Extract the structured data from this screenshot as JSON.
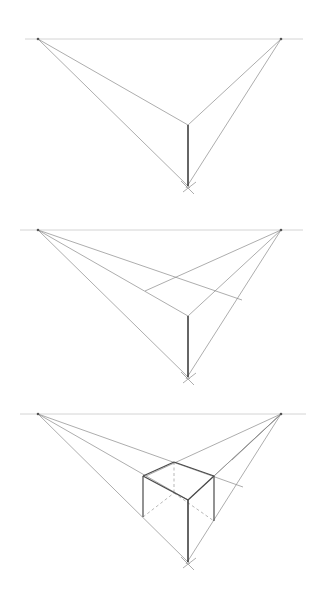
{
  "colors": {
    "background": "#ffffff",
    "horizon": "#c9c9c9",
    "guide": "#8a8a8a",
    "edge": "#4a4a4a",
    "hidden": "#9a9a9a"
  },
  "panels": [
    {
      "name": "step-1-vanishing-points",
      "horizon": {
        "x1": 25,
        "x2": 303,
        "y": 39
      },
      "vp_left": [
        38,
        39
      ],
      "vp_right": [
        281,
        39
      ],
      "vp_bottom": [
        188,
        186
      ],
      "guides": [
        [
          38,
          39,
          188,
          125
        ],
        [
          281,
          39,
          188,
          125
        ],
        [
          38,
          39,
          190,
          188
        ],
        [
          281,
          39,
          186,
          188
        ],
        [
          183,
          192,
          196,
          182
        ],
        [
          181,
          181,
          194,
          194
        ]
      ],
      "edges": [
        [
          188,
          125,
          188,
          186
        ]
      ],
      "hidden": []
    },
    {
      "name": "step-2-top-face",
      "horizon": {
        "x1": 20,
        "x2": 303,
        "y": 230
      },
      "vp_left": [
        38,
        230
      ],
      "vp_right": [
        281,
        230
      ],
      "vp_bottom": [
        188,
        377
      ],
      "guides": [
        [
          38,
          230,
          188,
          316
        ],
        [
          281,
          230,
          188,
          316
        ],
        [
          38,
          230,
          190,
          379
        ],
        [
          281,
          230,
          186,
          379
        ],
        [
          38,
          230,
          242,
          300
        ],
        [
          281,
          230,
          145,
          291
        ],
        [
          183,
          383,
          196,
          373
        ],
        [
          181,
          372,
          194,
          385
        ]
      ],
      "edges": [
        [
          188,
          316,
          188,
          377
        ]
      ],
      "hidden": []
    },
    {
      "name": "step-3-box",
      "horizon": {
        "x1": 20,
        "x2": 306,
        "y": 414
      },
      "vp_left": [
        38,
        414
      ],
      "vp_right": [
        281,
        414
      ],
      "vp_bottom": [
        188,
        562
      ],
      "guides": [
        [
          38,
          414,
          188,
          500
        ],
        [
          281,
          414,
          188,
          500
        ],
        [
          38,
          414,
          190,
          564
        ],
        [
          281,
          414,
          186,
          564
        ],
        [
          38,
          414,
          243,
          487
        ],
        [
          281,
          414,
          146,
          476
        ],
        [
          281,
          414,
          214,
          476
        ],
        [
          281,
          414,
          232,
          460
        ],
        [
          183,
          568,
          196,
          558
        ],
        [
          181,
          557,
          194,
          570
        ]
      ],
      "edges": [
        [
          188,
          500,
          188,
          562
        ],
        [
          143,
          476,
          143,
          517
        ],
        [
          214,
          476,
          214,
          521
        ],
        [
          143,
          476,
          174,
          462
        ],
        [
          174,
          462,
          214,
          476
        ],
        [
          143,
          476,
          188,
          500
        ],
        [
          188,
          500,
          214,
          476
        ]
      ],
      "hidden": [
        [
          174,
          462,
          174,
          493
        ],
        [
          143,
          517,
          174,
          493
        ],
        [
          174,
          493,
          214,
          521
        ]
      ]
    }
  ]
}
